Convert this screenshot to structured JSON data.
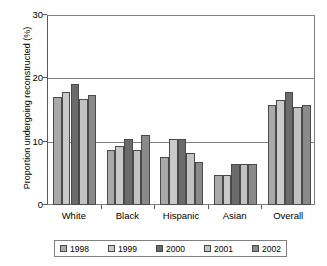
{
  "chart_data": {
    "type": "bar",
    "title": "",
    "xlabel": "",
    "ylabel": "Proportion undergoing reconstructed (%)",
    "categories": [
      "White",
      "Black",
      "Hispanic",
      "Asian",
      "Overall"
    ],
    "series": [
      {
        "name": "1998",
        "color": "#a9a9a9",
        "values": [
          17.1,
          8.7,
          7.7,
          4.8,
          15.9
        ]
      },
      {
        "name": "1999",
        "color": "#c9c9c9",
        "values": [
          18.0,
          9.4,
          10.4,
          4.8,
          16.6
        ]
      },
      {
        "name": "2000",
        "color": "#6b6b6b",
        "values": [
          19.2,
          10.5,
          10.4,
          6.5,
          17.9
        ]
      },
      {
        "name": "2001",
        "color": "#c2c2c2",
        "values": [
          16.9,
          8.8,
          8.3,
          6.5,
          15.6
        ]
      },
      {
        "name": "2002",
        "color": "#8a8a8a",
        "values": [
          17.5,
          11.1,
          6.9,
          6.5,
          15.9
        ]
      }
    ],
    "ylim": [
      0,
      30
    ],
    "yticks": [
      0,
      10,
      20,
      30
    ],
    "ytick_labels": [
      "0",
      "10",
      "20",
      "30"
    ],
    "grid": true,
    "legend_position": "bottom"
  }
}
